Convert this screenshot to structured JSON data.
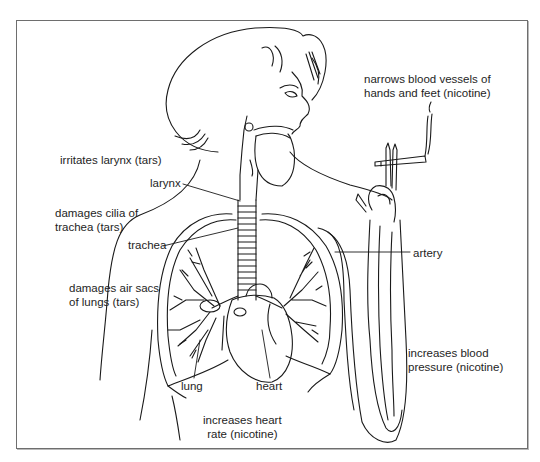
{
  "diagram": {
    "labels": {
      "narrows_vessels": [
        "narrows blood vessels of",
        "hands and feet (nicotine)"
      ],
      "irritates_larynx": "irritates larynx (tars)",
      "larynx": "larynx",
      "damages_cilia": [
        "damages cilia of",
        "trachea (tars)"
      ],
      "trachea": "trachea",
      "damages_air_sacs": [
        "damages air sacs",
        "of lungs (tars)"
      ],
      "artery": "artery",
      "lung": "lung",
      "heart": "heart",
      "increases_bp": [
        "increases blood",
        "pressure (nicotine)"
      ],
      "increases_hr": [
        "increases heart",
        "rate (nicotine)"
      ]
    },
    "colors": {
      "line": "#1a1a1a",
      "frame": "#6e6e6e",
      "background": "#ffffff"
    }
  }
}
